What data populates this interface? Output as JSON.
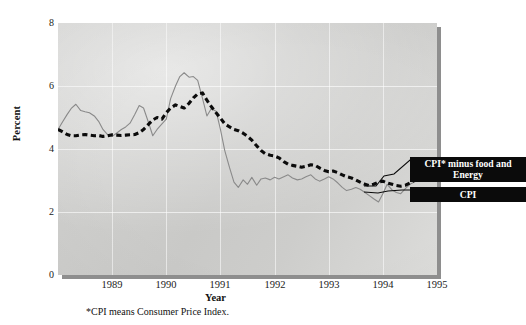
{
  "chart_data": {
    "type": "line",
    "title": "",
    "xlabel": "Year",
    "ylabel": "Percent",
    "xlim": [
      1988.5,
      1995.5
    ],
    "ylim": [
      0,
      8
    ],
    "yticks": [
      0,
      2,
      4,
      6,
      8
    ],
    "xticks": [
      1989,
      1990,
      1991,
      1992,
      1993,
      1994,
      1995
    ],
    "grid": true,
    "legend_position": "right",
    "footnote": "*CPI means Consumer Price Index.",
    "series": [
      {
        "name": "CPI* minus food and Energy",
        "style": "thick-dashed-black",
        "color": "#0b0b0b",
        "x": [
          1988.5,
          1988.58,
          1988.67,
          1988.75,
          1988.83,
          1988.92,
          1989.0,
          1989.08,
          1989.17,
          1989.25,
          1989.33,
          1989.42,
          1989.5,
          1989.58,
          1989.67,
          1989.75,
          1989.83,
          1989.92,
          1990.0,
          1990.08,
          1990.17,
          1990.25,
          1990.33,
          1990.42,
          1990.5,
          1990.58,
          1990.67,
          1990.75,
          1990.83,
          1990.92,
          1991.0,
          1991.08,
          1991.17,
          1991.25,
          1991.33,
          1991.42,
          1991.5,
          1991.58,
          1991.67,
          1991.75,
          1991.83,
          1991.92,
          1992.0,
          1992.08,
          1992.17,
          1992.25,
          1992.33,
          1992.42,
          1992.5,
          1992.58,
          1992.67,
          1992.75,
          1992.83,
          1992.92,
          1993.0,
          1993.08,
          1993.17,
          1993.25,
          1993.33,
          1993.42,
          1993.5,
          1993.58,
          1993.67,
          1993.75,
          1993.83,
          1993.92,
          1994.0,
          1994.08,
          1994.17,
          1994.25,
          1994.33,
          1994.42,
          1994.5,
          1994.58,
          1994.67,
          1994.75,
          1994.83,
          1994.92,
          1995.0,
          1995.08,
          1995.17,
          1995.25,
          1995.33
        ],
        "y": [
          4.62,
          4.55,
          4.46,
          4.42,
          4.42,
          4.45,
          4.46,
          4.44,
          4.42,
          4.43,
          4.4,
          4.42,
          4.45,
          4.44,
          4.43,
          4.44,
          4.45,
          4.46,
          4.52,
          4.62,
          4.78,
          4.92,
          5.0,
          4.95,
          5.15,
          5.3,
          5.4,
          5.35,
          5.3,
          5.45,
          5.62,
          5.75,
          5.78,
          5.55,
          5.35,
          5.15,
          4.98,
          4.8,
          4.7,
          4.62,
          4.58,
          4.5,
          4.4,
          4.28,
          4.1,
          3.95,
          3.85,
          3.8,
          3.78,
          3.72,
          3.6,
          3.52,
          3.48,
          3.45,
          3.42,
          3.45,
          3.5,
          3.48,
          3.4,
          3.32,
          3.28,
          3.3,
          3.25,
          3.18,
          3.12,
          3.08,
          3.02,
          2.95,
          2.88,
          2.84,
          2.88,
          2.95,
          2.98,
          2.92,
          2.88,
          2.84,
          2.82,
          2.85,
          2.92,
          3.0,
          3.05,
          3.12,
          3.08
        ]
      },
      {
        "name": "CPI",
        "style": "thin-solid-gray",
        "color": "#8a8a8a",
        "x": [
          1988.5,
          1988.58,
          1988.67,
          1988.75,
          1988.83,
          1988.92,
          1989.0,
          1989.08,
          1989.17,
          1989.25,
          1989.33,
          1989.42,
          1989.5,
          1989.58,
          1989.67,
          1989.75,
          1989.83,
          1989.92,
          1990.0,
          1990.08,
          1990.17,
          1990.25,
          1990.33,
          1990.42,
          1990.5,
          1990.58,
          1990.67,
          1990.75,
          1990.83,
          1990.92,
          1991.0,
          1991.08,
          1991.17,
          1991.25,
          1991.33,
          1991.42,
          1991.5,
          1991.58,
          1991.67,
          1991.75,
          1991.83,
          1991.92,
          1992.0,
          1992.08,
          1992.17,
          1992.25,
          1992.33,
          1992.42,
          1992.5,
          1992.58,
          1992.67,
          1992.75,
          1992.83,
          1992.92,
          1993.0,
          1993.08,
          1993.17,
          1993.25,
          1993.33,
          1993.42,
          1993.5,
          1993.58,
          1993.67,
          1993.75,
          1993.83,
          1993.92,
          1994.0,
          1994.08,
          1994.17,
          1994.25,
          1994.33,
          1994.42,
          1994.5,
          1994.58,
          1994.67,
          1994.75,
          1994.83,
          1994.92,
          1995.0,
          1995.08,
          1995.17,
          1995.25,
          1995.33
        ],
        "y": [
          4.62,
          4.85,
          5.1,
          5.3,
          5.42,
          5.22,
          5.18,
          5.15,
          5.05,
          4.88,
          4.62,
          4.45,
          4.4,
          4.5,
          4.62,
          4.7,
          4.82,
          5.1,
          5.38,
          5.3,
          4.85,
          4.42,
          4.62,
          4.8,
          4.95,
          5.6,
          6.0,
          6.3,
          6.42,
          6.28,
          6.3,
          6.18,
          5.6,
          5.05,
          5.28,
          5.2,
          4.62,
          3.95,
          3.4,
          2.95,
          2.78,
          3.02,
          2.88,
          3.1,
          2.85,
          3.05,
          3.08,
          3.02,
          3.1,
          3.05,
          3.12,
          3.18,
          3.08,
          3.02,
          3.05,
          3.12,
          3.18,
          3.05,
          2.98,
          3.05,
          3.12,
          3.05,
          2.92,
          2.78,
          2.68,
          2.72,
          2.78,
          2.72,
          2.62,
          2.52,
          2.42,
          2.32,
          2.58,
          2.88,
          2.7,
          2.62,
          2.58,
          2.75,
          2.88,
          2.95,
          3.02,
          3.08,
          3.0
        ]
      }
    ]
  },
  "axes": {
    "ylabel": "Percent",
    "xlabel": "Year",
    "yticks": [
      "8",
      "6",
      "4",
      "2",
      "0"
    ],
    "xticks": [
      "1989",
      "1990",
      "1991",
      "1992",
      "1993",
      "1994",
      "1995"
    ]
  },
  "legend": {
    "core_label": "CPI* minus food and Energy",
    "cpi_label": "CPI"
  },
  "footnote": "*CPI means Consumer Price Index."
}
